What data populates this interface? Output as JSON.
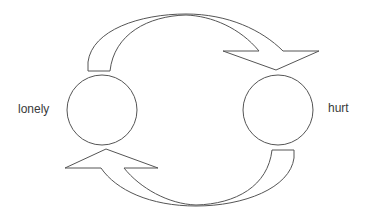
{
  "diagram": {
    "type": "cycle",
    "nodes": [
      {
        "id": "left",
        "label": "lonely"
      },
      {
        "id": "right",
        "label": "hurt"
      }
    ],
    "edges": [
      {
        "from": "lonely",
        "to": "hurt",
        "direction": "clockwise-top"
      },
      {
        "from": "hurt",
        "to": "lonely",
        "direction": "clockwise-bottom"
      }
    ],
    "colors": {
      "stroke": "#555555",
      "fill": "#ffffff",
      "text": "#3a3a3a"
    }
  }
}
